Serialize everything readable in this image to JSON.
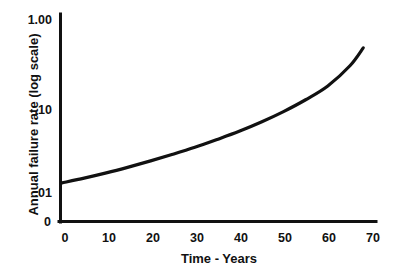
{
  "chart_data": {
    "type": "line",
    "title": "",
    "subtitle": "",
    "xlabel": "Time - Years",
    "ylabel": "Annual failure rate (log scale)",
    "yscale": "log",
    "xscale": "linear",
    "xlim": [
      0,
      70
    ],
    "ylim": [
      0.01,
      1.0
    ],
    "grid": false,
    "legend": null,
    "origin_label": "0",
    "x_ticks": [
      {
        "value": 0,
        "label": "0"
      },
      {
        "value": 10,
        "label": "10"
      },
      {
        "value": 20,
        "label": "20"
      },
      {
        "value": 30,
        "label": "30"
      },
      {
        "value": 40,
        "label": "40"
      },
      {
        "value": 50,
        "label": "50"
      },
      {
        "value": 60,
        "label": "60"
      },
      {
        "value": 70,
        "label": "70"
      }
    ],
    "y_ticks": [
      {
        "value": 1.0,
        "label": "1.00"
      },
      {
        "value": 0.1,
        "label": ".10"
      },
      {
        "value": 0.01,
        "label": ".01"
      }
    ],
    "series": [
      {
        "name": "Annual failure rate",
        "color": "#111111",
        "x": [
          0,
          5,
          10,
          15,
          20,
          25,
          30,
          35,
          40,
          45,
          50,
          55,
          60,
          65,
          68
        ],
        "y": [
          0.0155,
          0.0175,
          0.02,
          0.0232,
          0.0272,
          0.0322,
          0.0385,
          0.047,
          0.058,
          0.0735,
          0.096,
          0.13,
          0.185,
          0.31,
          0.49
        ]
      }
    ]
  },
  "axes": {
    "x_axis_name": "x-axis",
    "y_axis_name": "y-axis"
  }
}
